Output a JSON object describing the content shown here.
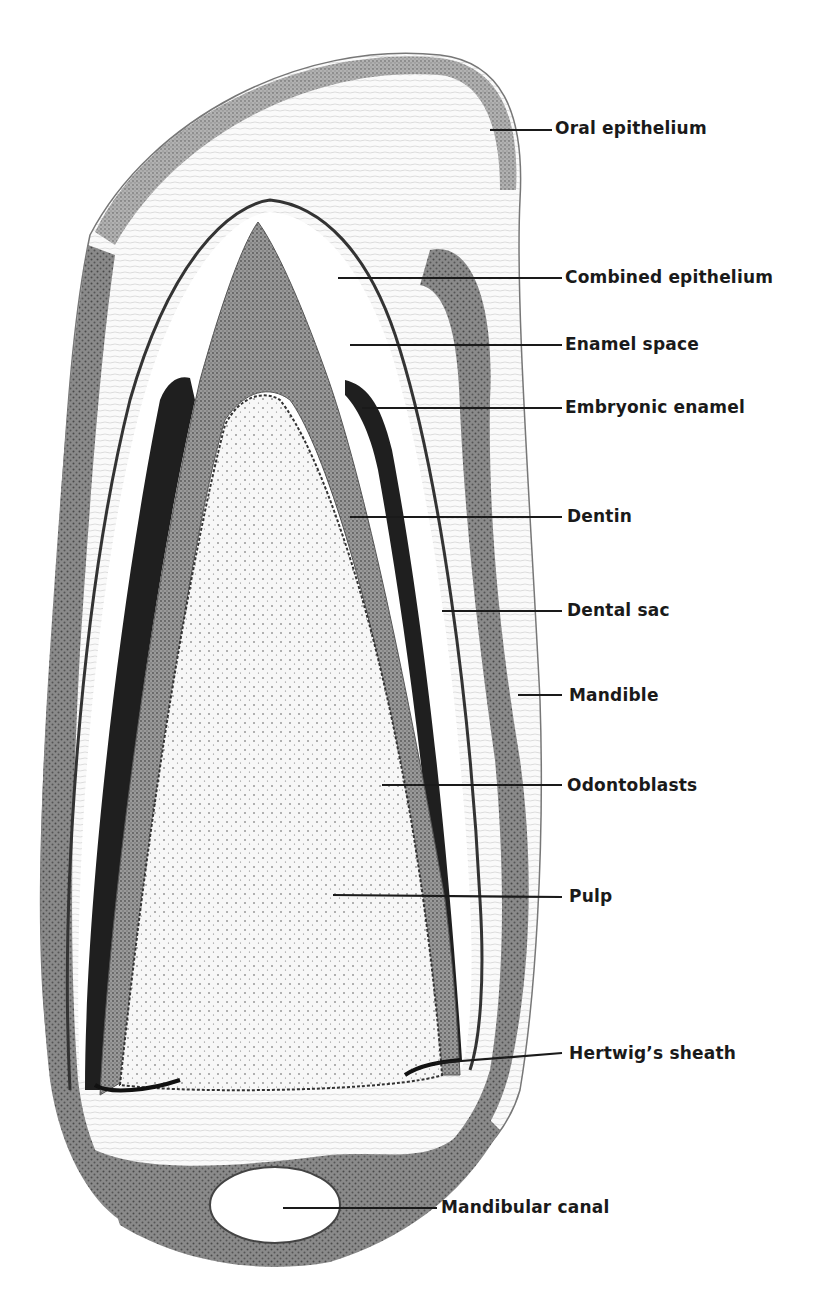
{
  "figure": {
    "colors": {
      "background": "#ffffff",
      "ink": "#1a1a1a",
      "bone": "#8c8c8c",
      "dentin": "#9a9a9a",
      "enamel": "#2a2a2a",
      "pulp": "#f4f4f4",
      "sac": "#f8f8f8"
    }
  },
  "labels": [
    {
      "id": "oral-epithelium",
      "text": "Oral epithelium",
      "x": 555,
      "y": 120,
      "line": [
        490,
        130,
        552,
        130
      ]
    },
    {
      "id": "combined-epithelium",
      "text": "Combined epithelium",
      "x": 565,
      "y": 268,
      "line": [
        338,
        278,
        562,
        278
      ]
    },
    {
      "id": "enamel-space",
      "text": "Enamel space",
      "x": 565,
      "y": 336,
      "line": [
        350,
        345,
        562,
        345
      ]
    },
    {
      "id": "embryonic-enamel",
      "text": "Embryonic enamel",
      "x": 565,
      "y": 399,
      "line": [
        362,
        408,
        562,
        408
      ]
    },
    {
      "id": "dentin",
      "text": "Dentin",
      "x": 567,
      "y": 508,
      "line": [
        350,
        517,
        562,
        517
      ]
    },
    {
      "id": "dental-sac",
      "text": "Dental sac",
      "x": 567,
      "y": 602,
      "line": [
        442,
        611,
        562,
        611
      ]
    },
    {
      "id": "mandible",
      "text": "Mandible",
      "x": 569,
      "y": 688,
      "line": [
        518,
        695,
        562,
        695
      ]
    },
    {
      "id": "odontoblasts",
      "text": "Odontoblasts",
      "x": 567,
      "y": 777,
      "line": [
        382,
        785,
        562,
        785
      ]
    },
    {
      "id": "pulp",
      "text": "Pulp",
      "x": 569,
      "y": 888,
      "line": [
        333,
        895,
        562,
        897
      ]
    },
    {
      "id": "hertwigs-sheath",
      "text": "Hertwig’s sheath",
      "x": 569,
      "y": 1046,
      "line": [
        436,
        1063,
        562,
        1053
      ]
    },
    {
      "id": "mandibular-canal",
      "text": "Mandibular canal",
      "x": 441,
      "y": 1199,
      "line": [
        283,
        1208,
        437,
        1208
      ]
    }
  ]
}
